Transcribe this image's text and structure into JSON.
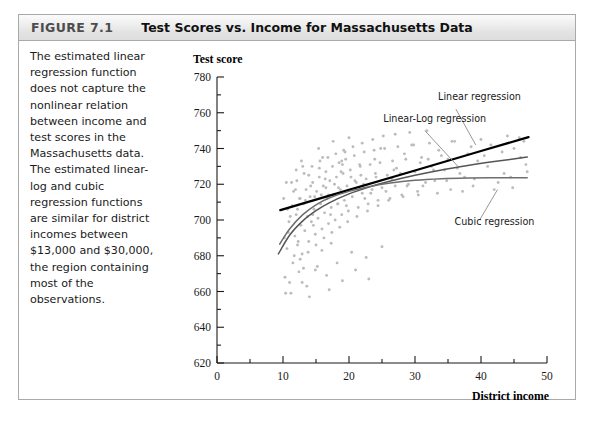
{
  "figure": {
    "label": "FIGURE 7.1",
    "title": "Test Scores vs. Income for Massachusetts Data",
    "caption": "The estimated linear regression function does not capture the nonlinear relation between income and test scores in the Massachusetts data. The estimated linear-log and cubic regression functions are similar for district incomes between $13,000 and $30,000, the region containing most of the observations."
  },
  "colors": {
    "header_border": "#a9a9a9",
    "header_label": "#4d4d4d",
    "scatter_point": "#bcbcbc",
    "linear_curve": "#000000",
    "linear_log_curve": "#555555",
    "cubic_curve": "#6e6e6e",
    "axis": "#1a1a1a",
    "leader_line": "#8a8a8a"
  },
  "chart_data": {
    "type": "scatter",
    "title": "Test Scores vs. Income for Massachusetts Data",
    "xlabel": "District income",
    "xlabel_sub": "(Thousands of dollars)",
    "ylabel": "Test score",
    "xlim": [
      0,
      50
    ],
    "ylim": [
      620,
      780
    ],
    "x_ticks": [
      0,
      10,
      20,
      30,
      40,
      50
    ],
    "x_tick_labels": [
      "0",
      "10",
      "20",
      "30",
      "40",
      "50"
    ],
    "x_minor_step": 5,
    "y_ticks": [
      620,
      640,
      660,
      680,
      700,
      720,
      740,
      760,
      780
    ],
    "y_tick_labels": [
      "620",
      "640",
      "660",
      "680",
      "700",
      "720",
      "740",
      "760",
      "780"
    ],
    "y_minor_step": 10,
    "grid": false,
    "legend_position": "in-plot-annotations",
    "annotations": [
      {
        "text": "Linear regression",
        "text_x": 33.5,
        "text_y": 767,
        "anchor": "start",
        "leader_from_x": 36.2,
        "leader_from_y": 762,
        "leader_to_x": 39.2,
        "leader_to_y": 742
      },
      {
        "text": "Linear-Log regression",
        "text_x": 25.2,
        "text_y": 755,
        "anchor": "start",
        "leader_from_x": 31.5,
        "leader_from_y": 750,
        "leader_to_x": 36.5,
        "leader_to_y": 730
      },
      {
        "text": "Cubic regression",
        "text_x": 36.0,
        "text_y": 697,
        "anchor": "start",
        "leader_from_x": 39.8,
        "leader_from_y": 700,
        "leader_to_x": 42.5,
        "leader_to_y": 717
      }
    ],
    "series": [
      {
        "name": "Linear regression",
        "type": "line",
        "style": "thick-dark",
        "points": [
          [
            9.6,
            705.5
          ],
          [
            20.0,
            716.8
          ],
          [
            30.0,
            727.7
          ],
          [
            40.0,
            738.6
          ],
          [
            47.2,
            746.4
          ]
        ]
      },
      {
        "name": "Linear-Log regression",
        "type": "line",
        "style": "medium",
        "points": [
          [
            9.3,
            681.0
          ],
          [
            11.0,
            691.5
          ],
          [
            13.0,
            699.5
          ],
          [
            15.0,
            705.2
          ],
          [
            17.0,
            709.6
          ],
          [
            20.0,
            714.6
          ],
          [
            23.0,
            718.4
          ],
          [
            26.0,
            721.5
          ],
          [
            30.0,
            725.0
          ],
          [
            34.0,
            728.0
          ],
          [
            38.0,
            730.5
          ],
          [
            42.0,
            732.7
          ],
          [
            47.0,
            735.2
          ]
        ]
      },
      {
        "name": "Cubic regression",
        "type": "line",
        "style": "medium",
        "points": [
          [
            9.5,
            686.5
          ],
          [
            11.0,
            695.0
          ],
          [
            13.0,
            703.0
          ],
          [
            15.0,
            708.5
          ],
          [
            17.0,
            712.3
          ],
          [
            20.0,
            716.0
          ],
          [
            23.0,
            718.6
          ],
          [
            26.0,
            720.5
          ],
          [
            30.0,
            722.2
          ],
          [
            34.0,
            723.1
          ],
          [
            38.0,
            723.5
          ],
          [
            42.0,
            723.6
          ],
          [
            47.0,
            723.6
          ]
        ]
      },
      {
        "name": "Massachusetts districts",
        "type": "scatter",
        "n_points": 220,
        "x_range": [
          9.5,
          47.0
        ],
        "y_range": [
          655,
          752
        ],
        "points": [
          [
            10.3,
            668.0
          ],
          [
            10.6,
            684.0
          ],
          [
            10.9,
            699.0
          ],
          [
            11.2,
            659.0
          ],
          [
            11.5,
            676.0
          ],
          [
            11.8,
            691.0
          ],
          [
            12.0,
            703.0
          ],
          [
            12.2,
            686.0
          ],
          [
            12.5,
            712.0
          ],
          [
            12.7,
            697.0
          ],
          [
            12.9,
            681.0
          ],
          [
            13.1,
            709.0
          ],
          [
            13.3,
            694.0
          ],
          [
            13.5,
            717.0
          ],
          [
            13.7,
            702.0
          ],
          [
            13.9,
            688.0
          ],
          [
            14.1,
            713.0
          ],
          [
            14.3,
            699.0
          ],
          [
            14.5,
            721.0
          ],
          [
            14.7,
            706.0
          ],
          [
            14.9,
            692.0
          ],
          [
            15.1,
            716.0
          ],
          [
            15.3,
            701.0
          ],
          [
            15.5,
            724.0
          ],
          [
            15.7,
            709.0
          ],
          [
            15.9,
            695.0
          ],
          [
            16.1,
            719.0
          ],
          [
            16.3,
            704.0
          ],
          [
            16.5,
            727.0
          ],
          [
            16.7,
            712.0
          ],
          [
            16.9,
            698.0
          ],
          [
            17.1,
            722.0
          ],
          [
            17.3,
            707.0
          ],
          [
            17.5,
            730.0
          ],
          [
            17.7,
            714.0
          ],
          [
            17.9,
            700.0
          ],
          [
            18.1,
            724.0
          ],
          [
            18.3,
            709.0
          ],
          [
            18.5,
            732.0
          ],
          [
            18.7,
            717.0
          ],
          [
            18.9,
            703.0
          ],
          [
            19.1,
            726.0
          ],
          [
            19.3,
            711.0
          ],
          [
            19.5,
            734.0
          ],
          [
            19.7,
            719.0
          ],
          [
            19.9,
            705.0
          ],
          [
            20.2,
            728.0
          ],
          [
            20.5,
            713.0
          ],
          [
            20.8,
            736.0
          ],
          [
            21.1,
            721.0
          ],
          [
            21.4,
            707.0
          ],
          [
            21.7,
            730.0
          ],
          [
            22.0,
            715.0
          ],
          [
            22.3,
            738.0
          ],
          [
            22.6,
            723.0
          ],
          [
            22.9,
            709.0
          ],
          [
            23.2,
            731.0
          ],
          [
            23.5,
            717.0
          ],
          [
            23.8,
            739.0
          ],
          [
            24.1,
            724.0
          ],
          [
            24.4,
            711.0
          ],
          [
            24.7,
            732.0
          ],
          [
            25.0,
            718.0
          ],
          [
            25.4,
            740.0
          ],
          [
            25.8,
            725.0
          ],
          [
            26.2,
            712.0
          ],
          [
            26.6,
            733.0
          ],
          [
            27.0,
            719.0
          ],
          [
            27.4,
            741.0
          ],
          [
            27.8,
            726.0
          ],
          [
            28.2,
            713.0
          ],
          [
            28.6,
            734.0
          ],
          [
            29.0,
            720.0
          ],
          [
            29.5,
            742.0
          ],
          [
            30.0,
            727.0
          ],
          [
            30.5,
            714.0
          ],
          [
            31.0,
            735.0
          ],
          [
            31.6,
            721.0
          ],
          [
            32.2,
            743.0
          ],
          [
            32.8,
            728.0
          ],
          [
            33.4,
            715.0
          ],
          [
            34.0,
            736.0
          ],
          [
            34.8,
            722.0
          ],
          [
            35.6,
            744.0
          ],
          [
            36.4,
            729.0
          ],
          [
            37.2,
            716.0
          ],
          [
            38.0,
            737.0
          ],
          [
            39.0,
            723.0
          ],
          [
            40.0,
            745.0
          ],
          [
            41.0,
            730.0
          ],
          [
            42.0,
            717.0
          ],
          [
            43.2,
            738.0
          ],
          [
            44.5,
            724.0
          ],
          [
            45.8,
            746.0
          ],
          [
            46.8,
            731.0
          ],
          [
            10.1,
            712.0
          ],
          [
            10.8,
            693.0
          ],
          [
            11.4,
            708.0
          ],
          [
            12.1,
            722.0
          ],
          [
            12.6,
            678.0
          ],
          [
            13.2,
            726.0
          ],
          [
            13.8,
            682.0
          ],
          [
            14.4,
            730.0
          ],
          [
            15.0,
            686.0
          ],
          [
            15.6,
            733.0
          ],
          [
            16.2,
            690.0
          ],
          [
            16.8,
            735.0
          ],
          [
            17.4,
            693.0
          ],
          [
            18.0,
            737.0
          ],
          [
            18.6,
            696.0
          ],
          [
            19.2,
            739.0
          ],
          [
            19.8,
            699.0
          ],
          [
            20.6,
            741.0
          ],
          [
            21.2,
            702.0
          ],
          [
            22.0,
            743.0
          ],
          [
            22.8,
            705.0
          ],
          [
            23.6,
            745.0
          ],
          [
            24.4,
            708.0
          ],
          [
            25.2,
            747.0
          ],
          [
            26.0,
            711.0
          ],
          [
            27.0,
            748.0
          ],
          [
            28.0,
            714.0
          ],
          [
            29.2,
            749.0
          ],
          [
            30.4,
            716.0
          ],
          [
            31.8,
            750.0
          ],
          [
            11.0,
            665.0
          ],
          [
            12.4,
            671.0
          ],
          [
            13.6,
            663.0
          ],
          [
            15.2,
            674.0
          ],
          [
            16.6,
            669.0
          ],
          [
            14.0,
            657.0
          ],
          [
            17.0,
            661.0
          ],
          [
            19.0,
            666.0
          ],
          [
            21.0,
            672.0
          ],
          [
            23.0,
            667.0
          ],
          [
            10.5,
            721.0
          ],
          [
            11.6,
            716.0
          ],
          [
            12.8,
            733.0
          ],
          [
            14.2,
            719.0
          ],
          [
            15.4,
            740.0
          ],
          [
            16.4,
            723.0
          ],
          [
            17.6,
            744.0
          ],
          [
            18.8,
            727.0
          ],
          [
            20.0,
            746.0
          ],
          [
            21.6,
            731.0
          ],
          [
            11.1,
            702.0
          ],
          [
            12.3,
            688.0
          ],
          [
            13.4,
            711.0
          ],
          [
            14.6,
            697.0
          ],
          [
            15.8,
            714.0
          ],
          [
            17.2,
            703.0
          ],
          [
            18.4,
            718.0
          ],
          [
            19.6,
            708.0
          ],
          [
            20.9,
            722.0
          ],
          [
            22.4,
            712.0
          ],
          [
            24.0,
            726.0
          ],
          [
            25.6,
            716.0
          ],
          [
            27.2,
            729.0
          ],
          [
            28.8,
            719.0
          ],
          [
            30.8,
            732.0
          ],
          [
            33.0,
            722.0
          ],
          [
            35.0,
            734.0
          ],
          [
            37.5,
            724.0
          ],
          [
            40.5,
            736.0
          ],
          [
            43.5,
            726.0
          ],
          [
            10.2,
            690.0
          ],
          [
            11.3,
            721.0
          ],
          [
            12.2,
            706.0
          ],
          [
            13.0,
            730.0
          ],
          [
            14.8,
            713.0
          ],
          [
            16.0,
            735.0
          ],
          [
            17.8,
            720.0
          ],
          [
            19.4,
            738.0
          ],
          [
            21.8,
            725.0
          ],
          [
            24.8,
            740.0
          ],
          [
            26.8,
            728.0
          ],
          [
            29.8,
            742.0
          ],
          [
            32.5,
            730.0
          ],
          [
            36.0,
            744.0
          ],
          [
            39.5,
            733.0
          ],
          [
            44.0,
            747.0
          ],
          [
            46.0,
            735.0
          ],
          [
            45.0,
            740.0
          ],
          [
            47.0,
            727.0
          ],
          [
            12.9,
            665.0
          ],
          [
            14.9,
            672.0
          ],
          [
            18.2,
            676.0
          ],
          [
            20.4,
            682.0
          ],
          [
            22.6,
            679.0
          ],
          [
            25.0,
            685.0
          ],
          [
            11.9,
            717.0
          ],
          [
            13.9,
            725.0
          ],
          [
            16.9,
            714.0
          ],
          [
            18.9,
            733.0
          ],
          [
            22.2,
            720.0
          ],
          [
            10.7,
            706.0
          ],
          [
            12.6,
            712.0
          ],
          [
            14.5,
            703.0
          ],
          [
            16.5,
            718.0
          ],
          [
            18.3,
            709.0
          ],
          [
            20.3,
            724.0
          ],
          [
            23.3,
            715.0
          ],
          [
            26.5,
            723.0
          ],
          [
            31.2,
            719.0
          ],
          [
            34.5,
            728.0
          ],
          [
            10.4,
            659.0
          ],
          [
            11.7,
            680.0
          ],
          [
            13.1,
            673.0
          ],
          [
            15.9,
            683.0
          ],
          [
            17.3,
            687.0
          ],
          [
            12.0,
            728.0
          ],
          [
            15.5,
            729.0
          ],
          [
            19.0,
            731.0
          ],
          [
            23.9,
            734.0
          ],
          [
            28.4,
            737.0
          ],
          [
            33.6,
            739.0
          ],
          [
            38.5,
            741.0
          ],
          [
            41.5,
            742.0
          ],
          [
            46.5,
            744.0
          ],
          [
            44.8,
            718.0
          ],
          [
            42.6,
            721.0
          ],
          [
            38.8,
            719.0
          ],
          [
            36.8,
            726.0
          ],
          [
            35.4,
            717.0
          ],
          [
            32.0,
            734.0
          ]
        ]
      }
    ]
  }
}
